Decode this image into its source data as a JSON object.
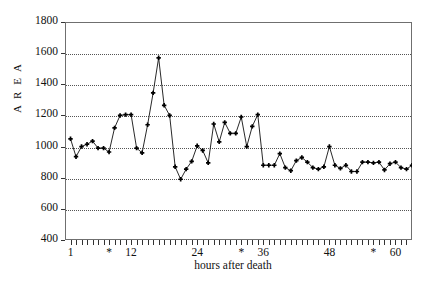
{
  "chart_data": {
    "type": "line",
    "title": "",
    "xlabel": "hours after death",
    "ylabel": "A R E A",
    "xlim": [
      0,
      63
    ],
    "ylim": [
      400,
      1800
    ],
    "ytick_values": [
      400,
      600,
      800,
      1000,
      1200,
      1400,
      1600,
      1800
    ],
    "ytick_labels": [
      "400",
      "600",
      "800",
      "1000",
      "1200",
      "1400",
      "1600",
      "1800"
    ],
    "xtick_labels": [
      {
        "x": 1,
        "text": "1"
      },
      {
        "x": 8,
        "text": "*"
      },
      {
        "x": 12,
        "text": "12"
      },
      {
        "x": 24,
        "text": "24"
      },
      {
        "x": 32,
        "text": "*"
      },
      {
        "x": 36,
        "text": "36"
      },
      {
        "x": 48,
        "text": "48"
      },
      {
        "x": 56,
        "text": "*"
      },
      {
        "x": 60,
        "text": "60"
      }
    ],
    "grid": "horizontal-dotted",
    "legend": "none",
    "marker": "plus",
    "x": [
      1,
      2,
      3,
      4,
      5,
      6,
      7,
      8,
      9,
      10,
      11,
      12,
      13,
      14,
      15,
      16,
      17,
      18,
      19,
      20,
      21,
      22,
      23,
      24,
      25,
      26,
      27,
      28,
      29,
      30,
      31,
      32,
      33,
      34,
      35,
      36,
      37,
      38,
      39,
      40,
      41,
      42,
      43,
      44,
      45,
      46,
      47,
      48,
      49,
      50,
      51,
      52,
      53,
      54,
      55,
      56,
      57,
      58,
      59,
      60,
      61,
      62,
      63,
      64,
      65
    ],
    "values": [
      1050,
      935,
      1000,
      1015,
      1035,
      990,
      990,
      965,
      1120,
      1200,
      1205,
      1205,
      990,
      960,
      1140,
      1345,
      1570,
      1265,
      1200,
      870,
      790,
      855,
      905,
      1005,
      975,
      895,
      1145,
      1030,
      1155,
      1085,
      1085,
      1190,
      1000,
      1130,
      1205,
      880,
      880,
      880,
      955,
      865,
      845,
      910,
      930,
      900,
      865,
      855,
      870,
      1000,
      880,
      860,
      880,
      840,
      840,
      900,
      900,
      895,
      900,
      850,
      890,
      900,
      865,
      855,
      880,
      840,
      845
    ]
  }
}
